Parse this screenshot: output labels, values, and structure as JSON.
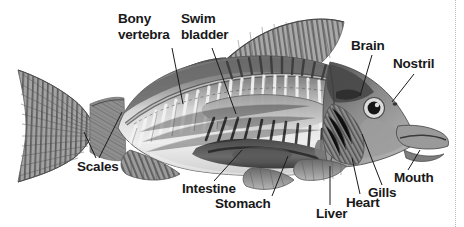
{
  "figure": {
    "background_color": "#ffffff",
    "label_color": "#191919",
    "leader_line_color": "#1a1a1a",
    "edge_rule": "dotted-vertical-line-right"
  },
  "labels": {
    "bony_vertebra": "Bony\nvertebra",
    "bony_vertebra_line1": "Bony",
    "bony_vertebra_line2": "vertebra",
    "swim_bladder_line1": "Swim",
    "swim_bladder_line2": "bladder",
    "brain": "Brain",
    "nostril": "Nostril",
    "scales": "Scales",
    "intestine": "Intestine",
    "stomach": "Stomach",
    "liver": "Liver",
    "heart": "Heart",
    "gills": "Gills",
    "mouth": "Mouth"
  },
  "callouts": [
    {
      "name": "bony-vertebra",
      "label": "Bony vertebra",
      "text_x": 119,
      "text_y": 12
    },
    {
      "name": "swim-bladder",
      "label": "Swim bladder",
      "text_x": 181,
      "text_y": 12
    },
    {
      "name": "brain",
      "label": "Brain",
      "text_x": 352,
      "text_y": 39
    },
    {
      "name": "nostril",
      "label": "Nostril",
      "text_x": 394,
      "text_y": 57
    },
    {
      "name": "scales",
      "label": "Scales",
      "text_x": 77,
      "text_y": 160
    },
    {
      "name": "intestine",
      "label": "Intestine",
      "text_x": 183,
      "text_y": 182
    },
    {
      "name": "stomach",
      "label": "Stomach",
      "text_x": 216,
      "text_y": 197
    },
    {
      "name": "liver",
      "label": "Liver",
      "text_x": 317,
      "text_y": 207
    },
    {
      "name": "heart",
      "label": "Heart",
      "text_x": 347,
      "text_y": 196
    },
    {
      "name": "gills",
      "label": "Gills",
      "text_x": 369,
      "text_y": 186
    },
    {
      "name": "mouth",
      "label": "Mouth",
      "text_x": 395,
      "text_y": 171
    }
  ]
}
